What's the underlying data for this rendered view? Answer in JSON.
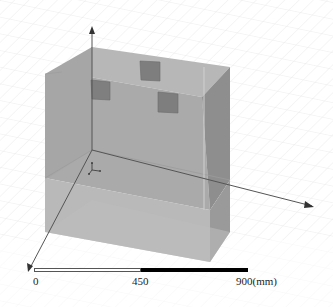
{
  "viewport": {
    "background": "#ffffff",
    "grid_color": "#e4e4e4",
    "box_colors": {
      "front": "#a9a9a9",
      "top": "#b4b4b4",
      "side": "#8f8f8f",
      "bottom_band": "#b9b9b9",
      "small_cube": "#7d7d7d"
    }
  },
  "axes": {
    "z_label": "z",
    "x_label": "x",
    "y_label": "y"
  },
  "scale_bar": {
    "tick_0": "0",
    "tick_mid": "450",
    "tick_end": "900(mm)"
  }
}
